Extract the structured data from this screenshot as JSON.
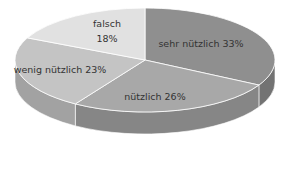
{
  "chart_data": {
    "type": "pie",
    "style": "3d",
    "title": "",
    "categories": [
      "sehr nützlich",
      "nützlich",
      "wenig nützlich",
      "falsch"
    ],
    "values": [
      33,
      26,
      23,
      18
    ],
    "unit": "%",
    "start_angle": "12 o'clock",
    "direction": "clockwise",
    "legend": "none (inline labels)",
    "labels": [
      {
        "text": "sehr nützlich 33%",
        "x": 201,
        "y": 47
      },
      {
        "text": "nützlich 26%",
        "x": 155,
        "y": 100
      },
      {
        "text": "wenig nützlich 23%",
        "x": 60,
        "y": 73
      },
      {
        "text": "falsch",
        "x": 107,
        "y": 27
      },
      {
        "text": "18%",
        "x": 107,
        "y": 42
      }
    ],
    "colors": {
      "top": [
        "#8f8f8f",
        "#a8a8a8",
        "#c4c4c4",
        "#e1e1e1"
      ],
      "side": [
        "#737373",
        "#868686",
        "#a2a2a2",
        "#bdbdbd"
      ]
    }
  }
}
